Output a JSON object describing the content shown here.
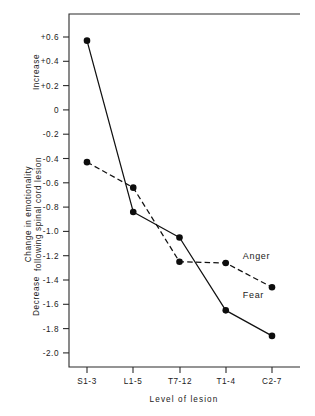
{
  "chart_data": {
    "type": "line",
    "title": "",
    "xlabel": "Level of lesion",
    "ylabel": "Change in emotionality following spinal cord lesion",
    "ylabel_line1": "Change in emotionality",
    "ylabel_line2": "following spinal cord lesion",
    "axis_direction_top": "Increase",
    "axis_direction_bottom": "Decrease",
    "categories": [
      "S1-3",
      "L1-5",
      "T7-12",
      "T1-4",
      "C2-7"
    ],
    "ylim": [
      -2.0,
      0.6
    ],
    "ytick_labels": [
      "+0.6",
      "+0.4",
      "+0.2",
      "0",
      "-0.2",
      "-0.4",
      "-0.6",
      "-0.8",
      "-1.0",
      "-1.2",
      "-1.4",
      "-1.6",
      "-1.8",
      "-2.0"
    ],
    "ytick_values": [
      0.6,
      0.4,
      0.2,
      0,
      -0.2,
      -0.4,
      -0.6,
      -0.8,
      -1.0,
      -1.2,
      -1.4,
      -1.6,
      -1.8,
      -2.0
    ],
    "grid": false,
    "legend_position": "inline-right",
    "series": [
      {
        "name": "Fear",
        "style": "solid",
        "marker": "filled-circle",
        "values": [
          0.57,
          -0.84,
          -1.05,
          -1.65,
          -1.86
        ],
        "label_x_category": "T1-4",
        "label_y_value": -1.52
      },
      {
        "name": "Anger",
        "style": "dashed",
        "marker": "filled-circle",
        "values": [
          -0.43,
          -0.64,
          -1.25,
          -1.26,
          -1.46
        ],
        "label_x_category": "T1-4",
        "label_y_value": -1.2
      }
    ]
  },
  "colors": {
    "background": "#ffffff",
    "axis": "#2b2b2b",
    "series": "#111111",
    "text": "#1a1a1a"
  }
}
